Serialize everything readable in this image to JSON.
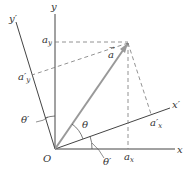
{
  "labels": {
    "y": "y",
    "y_prime": "y′",
    "x": "x",
    "x_prime": "x′",
    "origin": "O",
    "theta": "θ",
    "theta_prime_left": "θ′",
    "theta_prime_bottom": "θ′",
    "vector": "a",
    "a_y": {
      "base": "a",
      "sub": "y"
    },
    "a_y_prime": {
      "base": "a′",
      "sub": "y"
    },
    "a_x": {
      "base": "a",
      "sub": "x"
    },
    "a_x_prime": {
      "base": "a′",
      "sub": "x"
    }
  },
  "colors": {
    "axis": "#444444",
    "vector": "#999999",
    "dashed": "#777777"
  }
}
